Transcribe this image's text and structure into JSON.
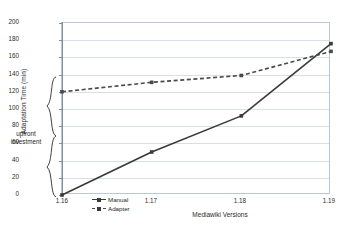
{
  "chart_data": {
    "type": "line",
    "title": "",
    "xlabel": "Mediawiki Versions",
    "ylabel": "Adaptation Time (min)",
    "categories": [
      "1.16",
      "1.17",
      "1.18",
      "1.19"
    ],
    "ylim": [
      0,
      200
    ],
    "yticks": [
      0,
      20,
      40,
      60,
      80,
      100,
      120,
      140,
      160,
      180,
      200
    ],
    "grid": true,
    "legend_position": "bottom-left",
    "series": [
      {
        "name": "Manual",
        "values": [
          0,
          50,
          92,
          176
        ],
        "style": "solid",
        "color": "#3a3a3a"
      },
      {
        "name": "Adapter",
        "values": [
          120,
          131,
          139,
          167
        ],
        "style": "dashed",
        "color": "#4a4a4a"
      }
    ],
    "annotations": [
      {
        "name": "upfront-investment",
        "text_line1": "upfront",
        "text_line2": "investment",
        "spans_y": [
          0,
          120
        ]
      }
    ]
  },
  "axis": {
    "y_title": "Adaptation Time (min)",
    "x_title": "Mediawiki Versions",
    "y_ticks": [
      "0",
      "20",
      "40",
      "60",
      "80",
      "100",
      "120",
      "140",
      "160",
      "180",
      "200"
    ],
    "x_ticks": [
      "1.16",
      "1.17",
      "1.18",
      "1.19"
    ]
  },
  "annotation": {
    "line1": "upfront",
    "line2": "investment"
  },
  "legend": {
    "items": [
      {
        "label": "Manual"
      },
      {
        "label": "Adapter"
      }
    ]
  },
  "colors": {
    "manual": "#3a3a3a",
    "adapter": "#4a4a4a",
    "grid": "#d6e0ea",
    "frame": "#b9c7d6",
    "text": "#2b2b2b"
  }
}
